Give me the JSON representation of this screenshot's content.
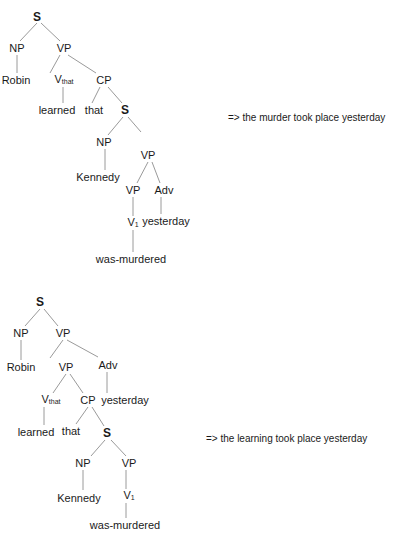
{
  "trees": [
    {
      "id": "tree-1",
      "gloss": "=> the murder took place yesterday",
      "gloss_pos": [
        228,
        112
      ],
      "nodes": [
        {
          "id": "S",
          "label": "S",
          "sub": "",
          "x": 37,
          "y": 17,
          "bold": true
        },
        {
          "id": "NP",
          "label": "NP",
          "sub": "",
          "x": 17,
          "y": 48
        },
        {
          "id": "VP",
          "label": "VP",
          "sub": "",
          "x": 64,
          "y": 48
        },
        {
          "id": "Robin",
          "label": "Robin",
          "sub": "",
          "x": 16,
          "y": 80
        },
        {
          "id": "Vthat",
          "label": "V",
          "sub": "that",
          "x": 64,
          "y": 80
        },
        {
          "id": "CP",
          "label": "CP",
          "sub": "",
          "x": 104,
          "y": 80
        },
        {
          "id": "learned",
          "label": "learned",
          "sub": "",
          "x": 57,
          "y": 110
        },
        {
          "id": "that",
          "label": "that",
          "sub": "",
          "x": 94,
          "y": 110
        },
        {
          "id": "S2",
          "label": "S",
          "sub": "",
          "x": 125,
          "y": 110,
          "bold": true
        },
        {
          "id": "NP2",
          "label": "NP",
          "sub": "",
          "x": 104,
          "y": 142
        },
        {
          "id": "VP2",
          "label": "VP",
          "sub": "",
          "x": 148,
          "y": 155
        },
        {
          "id": "Kennedy",
          "label": "Kennedy",
          "sub": "",
          "x": 98,
          "y": 177
        },
        {
          "id": "VP3",
          "label": "VP",
          "sub": "",
          "x": 133,
          "y": 190
        },
        {
          "id": "Adv",
          "label": "Adv",
          "sub": "",
          "x": 164,
          "y": 190
        },
        {
          "id": "V1",
          "label": "V",
          "sub": "1",
          "x": 133,
          "y": 223
        },
        {
          "id": "yesterday",
          "label": "yesterday",
          "sub": "",
          "x": 166,
          "y": 221
        },
        {
          "id": "was-murdered",
          "label": "was-murdered",
          "sub": "",
          "x": 131,
          "y": 259
        }
      ],
      "edges": [
        [
          37,
          23,
          20,
          41
        ],
        [
          41,
          23,
          60,
          41
        ],
        [
          17,
          55,
          17,
          73
        ],
        [
          60,
          55,
          50,
          73
        ],
        [
          68,
          55,
          96,
          73
        ],
        [
          63,
          87,
          63,
          103
        ],
        [
          100,
          87,
          92,
          103
        ],
        [
          108,
          87,
          122,
          103
        ],
        [
          123,
          117,
          108,
          135
        ],
        [
          128,
          117,
          141,
          132
        ],
        [
          148,
          162,
          137,
          183
        ],
        [
          152,
          162,
          160,
          183
        ],
        [
          105,
          149,
          105,
          170
        ],
        [
          133,
          197,
          133,
          216
        ],
        [
          161,
          197,
          161,
          214
        ],
        [
          133,
          230,
          133,
          252
        ]
      ]
    },
    {
      "id": "tree-2",
      "gloss": "=> the learning took place yesterday",
      "gloss_pos": [
        206,
        433
      ],
      "nodes": [
        {
          "id": "S",
          "label": "S",
          "sub": "",
          "x": 40,
          "y": 302,
          "bold": true
        },
        {
          "id": "NP",
          "label": "NP",
          "sub": "",
          "x": 21,
          "y": 333
        },
        {
          "id": "VP",
          "label": "VP",
          "sub": "",
          "x": 63,
          "y": 333
        },
        {
          "id": "Robin",
          "label": "Robin",
          "sub": "",
          "x": 21,
          "y": 367
        },
        {
          "id": "VP2",
          "label": "VP",
          "sub": "",
          "x": 66,
          "y": 367
        },
        {
          "id": "Adv",
          "label": "Adv",
          "sub": "",
          "x": 108,
          "y": 365
        },
        {
          "id": "Vthat",
          "label": "V",
          "sub": "that",
          "x": 51,
          "y": 400
        },
        {
          "id": "CP",
          "label": "CP",
          "sub": "",
          "x": 88,
          "y": 400
        },
        {
          "id": "yesterday",
          "label": "yesterday",
          "sub": "",
          "x": 125,
          "y": 400
        },
        {
          "id": "learned",
          "label": "learned",
          "sub": "",
          "x": 36,
          "y": 432
        },
        {
          "id": "that",
          "label": "that",
          "sub": "",
          "x": 71,
          "y": 431
        },
        {
          "id": "S2",
          "label": "S",
          "sub": "",
          "x": 107,
          "y": 433,
          "bold": true
        },
        {
          "id": "NP2",
          "label": "NP",
          "sub": "",
          "x": 83,
          "y": 463
        },
        {
          "id": "VP3",
          "label": "VP",
          "sub": "",
          "x": 129,
          "y": 463
        },
        {
          "id": "Kennedy",
          "label": "Kennedy",
          "sub": "",
          "x": 79,
          "y": 498
        },
        {
          "id": "V1",
          "label": "V",
          "sub": "1",
          "x": 129,
          "y": 496
        },
        {
          "id": "was-murdered",
          "label": "was-murdered",
          "sub": "",
          "x": 125,
          "y": 525
        }
      ],
      "edges": [
        [
          40,
          309,
          25,
          326
        ],
        [
          44,
          309,
          58,
          326
        ],
        [
          21,
          340,
          21,
          360
        ],
        [
          63,
          340,
          50,
          358
        ],
        [
          67,
          340,
          98,
          357
        ],
        [
          66,
          374,
          53,
          393
        ],
        [
          70,
          374,
          83,
          393
        ],
        [
          107,
          372,
          107,
          393
        ],
        [
          44,
          407,
          44,
          425
        ],
        [
          88,
          407,
          76,
          424
        ],
        [
          92,
          407,
          104,
          426
        ],
        [
          105,
          440,
          91,
          456
        ],
        [
          111,
          440,
          126,
          456
        ],
        [
          83,
          470,
          83,
          490
        ],
        [
          126,
          470,
          126,
          489
        ],
        [
          126,
          503,
          126,
          518
        ]
      ]
    }
  ]
}
